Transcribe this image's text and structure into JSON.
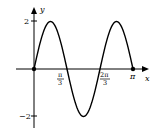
{
  "chart_data": {
    "type": "line",
    "title": "",
    "xlabel": "x",
    "ylabel": "y",
    "function": "y = 2 sin(3x)",
    "xlim": [
      0,
      3.1416
    ],
    "ylim": [
      -2,
      2
    ],
    "grid": false,
    "legend": null,
    "x_ticks": [
      {
        "value": 1.0472,
        "label_num": "π",
        "label_den": "3"
      },
      {
        "value": 2.0944,
        "label_num": "2π",
        "label_den": "3"
      },
      {
        "value": 3.1416,
        "label": "π"
      }
    ],
    "y_ticks": [
      {
        "value": 2,
        "label": "2"
      },
      {
        "value": -2,
        "label": "−2"
      }
    ],
    "series": [
      {
        "name": "2sin(3x)",
        "x": [
          0,
          0.5236,
          1.0472,
          1.5708,
          2.0944,
          2.618,
          3.1416
        ],
        "y": [
          0,
          2,
          0,
          -2,
          0,
          2,
          0
        ]
      }
    ],
    "marked_points": [
      {
        "x": 0,
        "y": 0
      },
      {
        "x": 3.1416,
        "y": 0
      }
    ]
  },
  "axes": {
    "x_label": "x",
    "y_label": "y",
    "tick_pi_over_3_num": "π",
    "tick_pi_over_3_den": "3",
    "tick_2pi_over_3_num": "2π",
    "tick_2pi_over_3_den": "3",
    "tick_pi": "π",
    "tick_y_pos": "2",
    "tick_y_neg": "−2"
  }
}
